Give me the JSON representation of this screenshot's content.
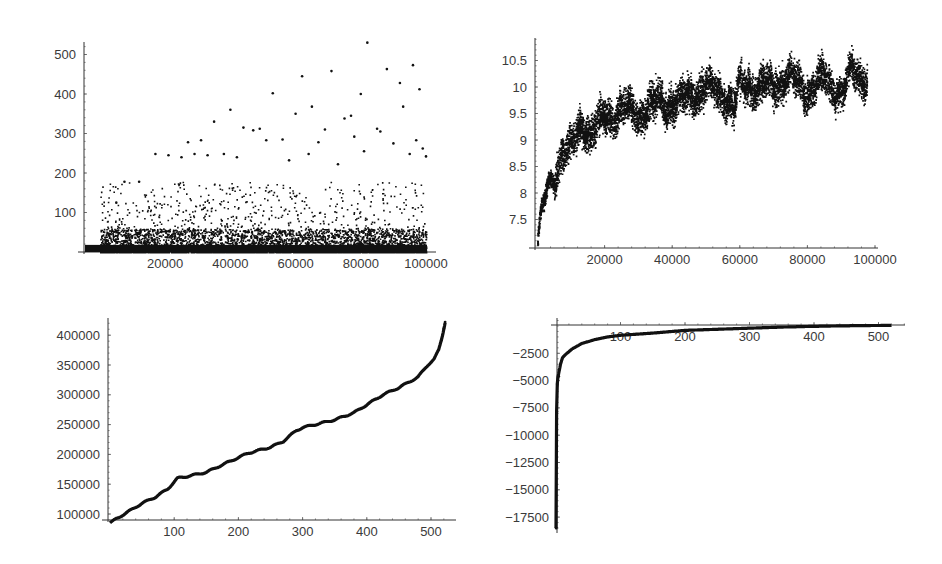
{
  "chart_data": [
    {
      "id": "panel-top-left",
      "type": "scatter",
      "title": "",
      "xlabel": "",
      "ylabel": "",
      "xlim": [
        0,
        103000
      ],
      "ylim": [
        0,
        540
      ],
      "grid": false,
      "legend": null,
      "x_ticks": [
        20000,
        40000,
        60000,
        80000,
        100000
      ],
      "x_tick_labels": [
        "20000",
        "40000",
        "60000",
        "80000",
        "100000"
      ],
      "y_ticks": [
        100,
        200,
        300,
        400,
        500
      ],
      "y_tick_labels": [
        "100",
        "200",
        "300",
        "400",
        "500"
      ],
      "description": "~100000 points; dense band between 0 and ~50, sparse outliers up to ~530 (max near x=80000)",
      "dense_band": [
        0,
        50
      ],
      "outliers": [
        {
          "x": 5000,
          "y": 125
        },
        {
          "x": 7500,
          "y": 178
        },
        {
          "x": 12000,
          "y": 178
        },
        {
          "x": 17000,
          "y": 248
        },
        {
          "x": 21000,
          "y": 245
        },
        {
          "x": 25000,
          "y": 240
        },
        {
          "x": 27000,
          "y": 278
        },
        {
          "x": 29000,
          "y": 248
        },
        {
          "x": 31000,
          "y": 283
        },
        {
          "x": 33000,
          "y": 245
        },
        {
          "x": 35000,
          "y": 330
        },
        {
          "x": 38000,
          "y": 248
        },
        {
          "x": 40000,
          "y": 360
        },
        {
          "x": 42000,
          "y": 240
        },
        {
          "x": 44000,
          "y": 315
        },
        {
          "x": 47000,
          "y": 308
        },
        {
          "x": 49000,
          "y": 312
        },
        {
          "x": 51000,
          "y": 283
        },
        {
          "x": 53000,
          "y": 402
        },
        {
          "x": 56000,
          "y": 285
        },
        {
          "x": 58000,
          "y": 232
        },
        {
          "x": 60000,
          "y": 350
        },
        {
          "x": 62000,
          "y": 445
        },
        {
          "x": 64000,
          "y": 248
        },
        {
          "x": 65000,
          "y": 368
        },
        {
          "x": 67000,
          "y": 278
        },
        {
          "x": 69000,
          "y": 310
        },
        {
          "x": 71000,
          "y": 458
        },
        {
          "x": 73000,
          "y": 222
        },
        {
          "x": 75000,
          "y": 338
        },
        {
          "x": 77000,
          "y": 345
        },
        {
          "x": 78000,
          "y": 292
        },
        {
          "x": 80000,
          "y": 400
        },
        {
          "x": 81000,
          "y": 255
        },
        {
          "x": 82000,
          "y": 530
        },
        {
          "x": 85000,
          "y": 312
        },
        {
          "x": 86000,
          "y": 305
        },
        {
          "x": 88000,
          "y": 463
        },
        {
          "x": 90000,
          "y": 275
        },
        {
          "x": 92000,
          "y": 428
        },
        {
          "x": 93000,
          "y": 368
        },
        {
          "x": 95000,
          "y": 248
        },
        {
          "x": 96000,
          "y": 473
        },
        {
          "x": 97000,
          "y": 283
        },
        {
          "x": 98000,
          "y": 412
        },
        {
          "x": 99000,
          "y": 262
        },
        {
          "x": 100000,
          "y": 242
        }
      ]
    },
    {
      "id": "panel-top-right",
      "type": "scatter",
      "title": "",
      "xlabel": "",
      "ylabel": "",
      "xlim": [
        0,
        102000
      ],
      "ylim": [
        7.0,
        10.95
      ],
      "grid": false,
      "legend": null,
      "x_ticks": [
        20000,
        40000,
        60000,
        80000,
        100000
      ],
      "x_tick_labels": [
        "20000",
        "40000",
        "60000",
        "80000",
        "100000"
      ],
      "y_ticks": [
        7.5,
        8,
        8.5,
        9,
        9.5,
        10,
        10.5
      ],
      "y_tick_labels": [
        "7.5",
        "8",
        "8.5",
        "9",
        "9.5",
        "10",
        "10.5"
      ],
      "description": "Dense noisy band rising logarithmically then plateauing near 10-10.3",
      "trend": {
        "x": [
          0,
          1000,
          3000,
          5000,
          7000,
          10000,
          13000,
          16000,
          20000,
          25000,
          30000,
          35000,
          40000,
          45000,
          50000,
          55000,
          58000,
          60000,
          65000,
          70000,
          75000,
          80000,
          85000,
          90000,
          93000,
          97000
        ],
        "y": [
          7.1,
          7.6,
          8.1,
          8.3,
          8.8,
          8.85,
          9.3,
          9.15,
          9.45,
          9.6,
          9.5,
          9.75,
          9.7,
          9.85,
          10.0,
          9.9,
          9.6,
          10.1,
          10.0,
          10.05,
          10.2,
          9.9,
          10.2,
          9.85,
          10.35,
          10.15
        ]
      },
      "noise_band": 0.25
    },
    {
      "id": "panel-bottom-left",
      "type": "line",
      "title": "",
      "xlabel": "",
      "ylabel": "",
      "xlim": [
        0,
        540
      ],
      "ylim": [
        88000,
        430000
      ],
      "x_axis_at_y": 95000,
      "grid": false,
      "legend": null,
      "x_ticks": [
        100,
        200,
        300,
        400,
        500
      ],
      "x_tick_labels": [
        "100",
        "200",
        "300",
        "400",
        "500"
      ],
      "y_ticks": [
        100000,
        150000,
        200000,
        250000,
        300000,
        350000,
        400000
      ],
      "y_tick_labels": [
        "100000",
        "150000",
        "200000",
        "250000",
        "300000",
        "350000",
        "400000"
      ],
      "x": [
        0,
        10,
        30,
        50,
        70,
        90,
        105,
        120,
        150,
        180,
        215,
        250,
        270,
        290,
        300,
        350,
        380,
        425,
        450,
        480,
        495,
        505,
        512,
        518,
        522
      ],
      "y": [
        85000,
        92000,
        105000,
        118000,
        128000,
        142000,
        160000,
        163000,
        170000,
        185000,
        202000,
        212000,
        222000,
        240000,
        245000,
        258000,
        270000,
        300000,
        312000,
        330000,
        350000,
        360000,
        375000,
        400000,
        422000
      ]
    },
    {
      "id": "panel-bottom-right",
      "type": "line",
      "title": "",
      "xlabel": "",
      "ylabel": "",
      "xlim": [
        0,
        540
      ],
      "ylim": [
        -19000,
        300
      ],
      "grid": false,
      "legend": null,
      "x_ticks": [
        100,
        200,
        300,
        400,
        500
      ],
      "x_tick_labels": [
        "100",
        "200",
        "300",
        "400",
        "500"
      ],
      "y_ticks": [
        -2500,
        -5000,
        -7500,
        -10000,
        -12500,
        -15000,
        -17500
      ],
      "y_tick_labels": [
        "-2500",
        "-5000",
        "-7500",
        "-10000",
        "-12500",
        "-15000",
        "-17500"
      ],
      "x": [
        0,
        1,
        2,
        3,
        5,
        7,
        10,
        15,
        25,
        40,
        60,
        80,
        100,
        150,
        180,
        200,
        250,
        300,
        350,
        400,
        450,
        520
      ],
      "y": [
        -18500,
        -7800,
        -5300,
        -4700,
        -4100,
        -3500,
        -2900,
        -2600,
        -2100,
        -1600,
        -1250,
        -1000,
        -850,
        -650,
        -500,
        -400,
        -300,
        -200,
        -100,
        -30,
        20,
        60
      ]
    }
  ]
}
